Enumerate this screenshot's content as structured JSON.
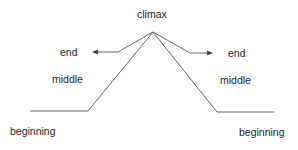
{
  "diagram": {
    "labels": {
      "climax": "climax",
      "left_end": "end",
      "left_middle": "middle",
      "left_beginning": "beginning",
      "right_end": "end",
      "right_middle": "middle",
      "right_beginning": "beginning"
    },
    "colors": {
      "line": "#555555",
      "text": "#222222",
      "background": "#ffffff"
    }
  }
}
